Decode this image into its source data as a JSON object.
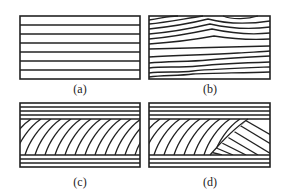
{
  "panels": [
    {
      "id": "a",
      "label": "(a)",
      "description": "Uniform parallel horizontal layers"
    },
    {
      "id": "b",
      "label": "(b)",
      "description": "Wavy, undulating horizontal layers"
    },
    {
      "id": "c",
      "label": "(c)",
      "description": "Horizontal layers top and bottom with diagonally inclined curved layers between"
    },
    {
      "id": "d",
      "label": "(d)",
      "description": "Horizontal layers top and bottom with two sets of cross-cutting inclined layers between"
    }
  ],
  "colors": {
    "line": "#222222",
    "background": "#ffffff"
  }
}
